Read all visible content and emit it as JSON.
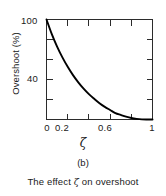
{
  "chart_data": {
    "type": "line",
    "title": "",
    "xlabel": "ζ",
    "ylabel": "Overshoot (%)",
    "xlim": [
      0,
      1
    ],
    "ylim": [
      0,
      100
    ],
    "grid": false,
    "legend": null,
    "x_ticks": [
      0,
      0.2,
      0.4,
      0.6,
      0.8,
      1
    ],
    "x_tick_labels": [
      "0",
      "",
      "0.2",
      "",
      "0.6",
      "",
      "1"
    ],
    "x_tick_labels_shown": [
      "0",
      "0.2",
      "0.6",
      "1"
    ],
    "y_ticks": [
      0,
      20,
      40,
      60,
      80,
      100
    ],
    "y_tick_labels_shown": [
      "40",
      "100"
    ],
    "series": [
      {
        "name": "Percent overshoot",
        "x": [
          0.0,
          0.05,
          0.1,
          0.15,
          0.2,
          0.25,
          0.3,
          0.35,
          0.4,
          0.45,
          0.5,
          0.55,
          0.6,
          0.65,
          0.7,
          0.75,
          0.8,
          0.85,
          0.9,
          0.95,
          1.0
        ],
        "values": [
          100.0,
          85.4,
          72.9,
          62.1,
          52.7,
          44.4,
          37.2,
          30.9,
          25.4,
          20.7,
          16.3,
          12.6,
          9.5,
          6.4,
          4.6,
          2.9,
          1.5,
          0.63,
          0.15,
          0.01,
          0.0
        ]
      }
    ]
  },
  "plot": {
    "y_axis_title": "Overshoot (%)",
    "y_tick_100": "100",
    "y_tick_40": "40",
    "x_tick_0": "0",
    "x_tick_02": "0.2",
    "x_tick_06": "0.6",
    "x_tick_1": "1",
    "x_axis_symbol": "ζ",
    "line_color": "#000000",
    "axis_color": "#2b2b2b",
    "background_color": "#ffffff"
  },
  "caption": {
    "index": "(b)",
    "text_before": "The effect ",
    "symbol": "ζ",
    "text_after": " on overshoot",
    "full": "The effect ζ on overshoot"
  }
}
